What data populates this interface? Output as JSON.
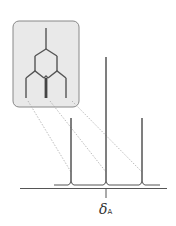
{
  "diagram": {
    "type": "nmr_doublet_of_doublets_splitting",
    "inset": {
      "description": "splitting tree",
      "levels": 3,
      "final_lines": 3,
      "center_line_intensity": "double"
    },
    "peaks": [
      {
        "position": "left",
        "relative_height": 0.5
      },
      {
        "position": "center",
        "relative_height": 1.0
      },
      {
        "position": "right",
        "relative_height": 0.5
      }
    ],
    "axis_label": {
      "symbol": "δ",
      "subscript": "A"
    },
    "colors": {
      "line": "#555555",
      "box_fill": "#e6e6e6",
      "box_border": "#888888",
      "dotted": "#999999"
    }
  }
}
